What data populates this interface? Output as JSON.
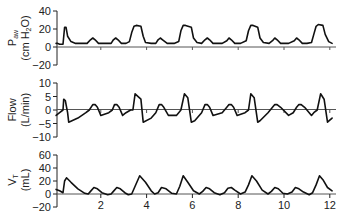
{
  "chart_data": [
    {
      "type": "line",
      "title": "",
      "ylabel": "Paw (cm H2O)",
      "ylabel_main": "P",
      "ylabel_sub": "aw",
      "ylabel_units_pre": "(cm H",
      "ylabel_units_sub": "2",
      "ylabel_units_post": "O)",
      "ylim": [
        -20,
        40
      ],
      "yticks": [
        40,
        20,
        0,
        -20
      ],
      "ytick_labels": [
        "40",
        "20",
        "0",
        "−20"
      ],
      "grid": false,
      "zero_line": true,
      "x": [
        0.05,
        0.12,
        0.2,
        0.35,
        0.42,
        0.48,
        0.55,
        0.7,
        0.9,
        1.2,
        1.4,
        1.55,
        1.65,
        1.75,
        1.9,
        2.2,
        2.45,
        2.55,
        2.65,
        2.75,
        2.9,
        3.1,
        3.25,
        3.35,
        3.45,
        3.55,
        3.75,
        3.85,
        3.95,
        4.2,
        4.4,
        4.5,
        4.6,
        4.7,
        4.9,
        5.2,
        5.4,
        5.5,
        5.6,
        5.7,
        5.95,
        6.05,
        6.2,
        6.4,
        6.55,
        6.65,
        6.75,
        6.9,
        7.3,
        7.5,
        7.6,
        7.7,
        7.85,
        8.1,
        8.35,
        8.45,
        8.55,
        8.65,
        8.85,
        8.95,
        9.1,
        9.35,
        9.5,
        9.6,
        9.7,
        9.85,
        10.2,
        10.45,
        10.55,
        10.65,
        10.8,
        11.0,
        11.2,
        11.3,
        11.4,
        11.5,
        11.7,
        11.8,
        11.95,
        12.1
      ],
      "values": [
        4,
        4,
        3,
        3,
        22,
        22,
        12,
        6,
        4,
        4,
        4,
        8,
        10,
        8,
        4,
        4,
        4,
        8,
        10,
        8,
        4,
        4,
        6,
        16,
        23,
        24,
        23,
        12,
        5,
        4,
        4,
        8,
        10,
        8,
        4,
        4,
        6,
        18,
        24,
        24,
        22,
        10,
        5,
        4,
        8,
        10,
        8,
        4,
        4,
        7,
        10,
        8,
        4,
        4,
        7,
        18,
        24,
        24,
        22,
        10,
        5,
        4,
        7,
        10,
        8,
        4,
        4,
        7,
        10,
        8,
        4,
        4,
        5,
        14,
        23,
        25,
        24,
        14,
        6,
        4
      ]
    },
    {
      "type": "line",
      "title": "",
      "ylabel": "Flow (L/min)",
      "ylabel_main": "Flow",
      "ylabel_units": "(L/min)",
      "ylim": [
        -10,
        10
      ],
      "yticks": [
        10,
        5,
        0,
        -5,
        -10
      ],
      "ytick_labels": [
        "10",
        "5",
        "0",
        "−5",
        "−10"
      ],
      "grid": false,
      "zero_line": true,
      "x": [
        0.05,
        0.2,
        0.35,
        0.38,
        0.45,
        0.55,
        0.6,
        1.0,
        1.35,
        1.5,
        1.65,
        1.75,
        1.85,
        2.0,
        2.35,
        2.5,
        2.6,
        2.7,
        2.8,
        2.95,
        3.1,
        3.3,
        3.4,
        3.5,
        3.75,
        3.85,
        4.2,
        4.4,
        4.55,
        4.65,
        4.75,
        4.95,
        5.3,
        5.4,
        5.5,
        5.65,
        5.8,
        5.95,
        6.1,
        6.4,
        6.55,
        6.65,
        6.75,
        6.9,
        7.3,
        7.5,
        7.6,
        7.7,
        7.8,
        7.95,
        8.3,
        8.45,
        8.55,
        8.7,
        8.85,
        8.95,
        9.3,
        9.5,
        9.6,
        9.7,
        9.85,
        10.2,
        10.4,
        10.55,
        10.65,
        10.75,
        10.9,
        11.2,
        11.3,
        11.45,
        11.6,
        11.75,
        11.9,
        12.1
      ],
      "values": [
        -2,
        -1,
        0,
        4,
        3.5,
        -1,
        -4.5,
        -3,
        -1,
        0,
        2,
        2,
        1,
        -2,
        -1,
        0,
        2,
        2,
        1,
        -2,
        -1,
        0,
        0,
        6,
        4,
        -4.5,
        -3,
        -1,
        2,
        2,
        1,
        -2,
        -2,
        -1,
        0,
        6,
        4.5,
        -4.5,
        -4,
        -1,
        2,
        2,
        1,
        -2,
        -1,
        1,
        2,
        2,
        1,
        -2,
        -1,
        0,
        6,
        4.5,
        -4.5,
        -4,
        -1,
        1,
        2,
        2,
        1,
        -2,
        -1,
        1,
        2,
        2,
        1,
        -2,
        -1,
        0,
        6,
        4,
        -4.5,
        -3
      ]
    },
    {
      "type": "line",
      "title": "",
      "ylabel": "VT (mL)",
      "ylabel_main": "V",
      "ylabel_sub": "T",
      "ylabel_units": "(mL)",
      "ylim": [
        -20,
        60
      ],
      "yticks": [
        60,
        40,
        20,
        0,
        -20
      ],
      "ytick_labels": [
        "60",
        "40",
        "20",
        "0",
        "−20"
      ],
      "grid": false,
      "zero_line": true,
      "xlabel": "",
      "xlim": [
        0,
        12.2
      ],
      "xticks": [
        2,
        4,
        6,
        8,
        10,
        12
      ],
      "xtick_labels": [
        "2",
        "4",
        "6",
        "8",
        "10",
        "12"
      ],
      "x": [
        0.05,
        0.2,
        0.35,
        0.42,
        0.5,
        0.7,
        1.0,
        1.3,
        1.45,
        1.55,
        1.7,
        1.85,
        2.05,
        2.3,
        2.45,
        2.55,
        2.7,
        2.85,
        3.05,
        3.2,
        3.35,
        3.5,
        3.7,
        3.95,
        4.2,
        4.35,
        4.5,
        4.65,
        4.85,
        5.1,
        5.3,
        5.45,
        5.6,
        5.8,
        6.05,
        6.3,
        6.45,
        6.6,
        6.75,
        6.95,
        7.2,
        7.4,
        7.55,
        7.7,
        7.85,
        8.1,
        8.3,
        8.45,
        8.6,
        8.8,
        9.05,
        9.3,
        9.45,
        9.6,
        9.75,
        9.95,
        10.15,
        10.35,
        10.5,
        10.65,
        10.85,
        11.1,
        11.25,
        11.4,
        11.55,
        11.7,
        11.9,
        12.1
      ],
      "values": [
        7,
        5,
        2,
        20,
        25,
        18,
        8,
        1,
        0,
        4,
        10,
        8,
        2,
        -1,
        0,
        4,
        10,
        8,
        2,
        -1,
        0,
        12,
        28,
        18,
        5,
        0,
        2,
        10,
        8,
        1,
        0,
        12,
        28,
        18,
        5,
        0,
        4,
        10,
        8,
        2,
        -1,
        2,
        9,
        10,
        6,
        0,
        3,
        14,
        28,
        20,
        6,
        0,
        4,
        10,
        8,
        1,
        0,
        3,
        10,
        8,
        3,
        -1,
        2,
        14,
        28,
        22,
        10,
        5
      ]
    }
  ]
}
